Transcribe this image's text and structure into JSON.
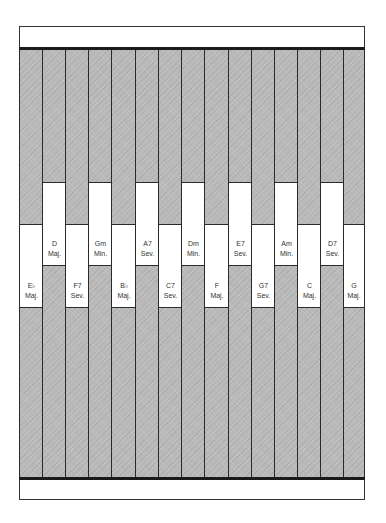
{
  "diagram": {
    "colors": {
      "strip_fill": "#b9b9b9",
      "box_fill": "#ffffff",
      "line": "#2a2a2a"
    },
    "strips": [
      {
        "root": "E♭",
        "quality": "Maj.",
        "position": "low"
      },
      {
        "root": "D",
        "quality": "Maj.",
        "position": "high"
      },
      {
        "root": "F7",
        "quality": "Sev.",
        "position": "low"
      },
      {
        "root": "Gm",
        "quality": "Min.",
        "position": "high"
      },
      {
        "root": "B♭",
        "quality": "Maj.",
        "position": "low"
      },
      {
        "root": "A7",
        "quality": "Sev.",
        "position": "high"
      },
      {
        "root": "C7",
        "quality": "Sev.",
        "position": "low"
      },
      {
        "root": "Dm",
        "quality": "Min.",
        "position": "high"
      },
      {
        "root": "F",
        "quality": "Maj.",
        "position": "low"
      },
      {
        "root": "E7",
        "quality": "Sev.",
        "position": "high"
      },
      {
        "root": "G7",
        "quality": "Sev.",
        "position": "low"
      },
      {
        "root": "Am",
        "quality": "Min.",
        "position": "high"
      },
      {
        "root": "C",
        "quality": "Maj.",
        "position": "low"
      },
      {
        "root": "D7",
        "quality": "Sev.",
        "position": "high"
      },
      {
        "root": "G",
        "quality": "Maj.",
        "position": "low"
      }
    ]
  }
}
